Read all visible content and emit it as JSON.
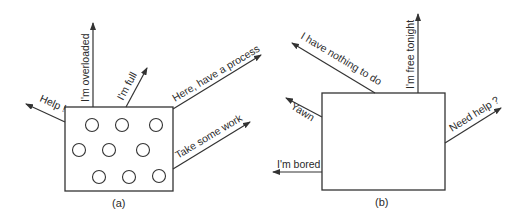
{
  "panel_a": {
    "caption": "(a)",
    "circle_count": 9,
    "messages": [
      {
        "id": "help",
        "label": "Help !"
      },
      {
        "id": "overloaded",
        "label": "I'm overloaded"
      },
      {
        "id": "full",
        "label": "I'm full"
      },
      {
        "id": "have_process",
        "label": "Here, have a process"
      },
      {
        "id": "take_work",
        "label": "Take some work"
      }
    ]
  },
  "panel_b": {
    "caption": "(b)",
    "messages": [
      {
        "id": "nothing_to_do",
        "label": "I have nothing to do"
      },
      {
        "id": "free_tonight",
        "label": "I'm free tonight"
      },
      {
        "id": "yawn",
        "label": "Yawn"
      },
      {
        "id": "need_help",
        "label": "Need help ?"
      },
      {
        "id": "bored",
        "label": "I'm bored"
      }
    ]
  },
  "colors": {
    "stroke": "#333333",
    "text": "#2a2a2a",
    "background": "#ffffff"
  }
}
